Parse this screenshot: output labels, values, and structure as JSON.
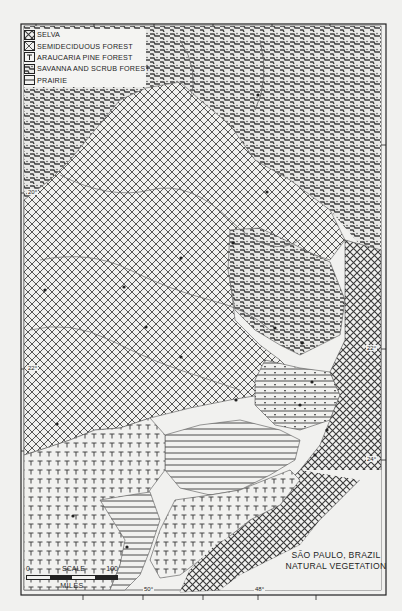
{
  "map": {
    "title_line1": "SÃO PAULO, BRAZIL",
    "title_line2": "NATURAL VEGETATION",
    "legend": [
      {
        "key": "selva",
        "label": "SELVA",
        "pattern": "double-cross-hatch"
      },
      {
        "key": "semideciduous",
        "label": "SEMIDECIDUOUS FOREST",
        "pattern": "cross-hatch"
      },
      {
        "key": "araucaria",
        "label": "ARAUCARIA PINE FOREST",
        "pattern": "T-symbols"
      },
      {
        "key": "savanna",
        "label": "SAVANNA AND SCRUB FOREST",
        "pattern": "dotted-zigzag"
      },
      {
        "key": "prairie",
        "label": "PRAIRIE",
        "pattern": "horizontal-lines"
      }
    ],
    "scale": {
      "label": "SCALE",
      "start": "0",
      "end": "100",
      "units": "MILES"
    },
    "coordinates": {
      "lat_20": "20°",
      "lat_22_left": "22°",
      "lat_22_right": "22°",
      "lat_24": "24°",
      "lon_50": "50°",
      "lon_48": "48°"
    },
    "colors": {
      "ink": "#1e1e1e",
      "paper": "#f1f1ef"
    }
  }
}
